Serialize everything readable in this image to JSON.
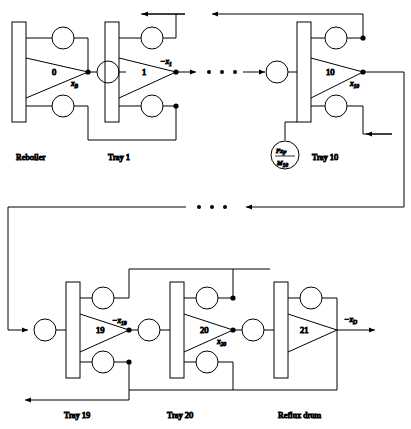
{
  "figure": {
    "type": "signal-flow-block-diagram",
    "stroke_color": "#000000",
    "background": "#ffffff"
  },
  "stages": [
    {
      "id": "reboiler",
      "caption": "Reboiler",
      "amplifier_number": "0",
      "output_signal": "x",
      "output_subscript": "B",
      "output_sign": "",
      "has_feed": false
    },
    {
      "id": "tray1",
      "caption": "Tray 1",
      "amplifier_number": "1",
      "output_signal": "x",
      "output_subscript": "1",
      "output_sign": "−",
      "has_feed": false
    },
    {
      "id": "tray10",
      "caption": "Tray 10",
      "amplifier_number": "10",
      "output_signal": "x",
      "output_subscript": "10",
      "output_sign": "",
      "has_feed": true,
      "feed_numerator": "Fx",
      "feed_numerator_sub": "F",
      "feed_denominator": "M",
      "feed_denominator_sub": "10"
    },
    {
      "id": "tray19",
      "caption": "Tray 19",
      "amplifier_number": "19",
      "output_signal": "x",
      "output_subscript": "19",
      "output_sign": "−",
      "has_feed": false
    },
    {
      "id": "tray20",
      "caption": "Tray 20",
      "amplifier_number": "20",
      "output_signal": "x",
      "output_subscript": "20",
      "output_sign": "",
      "has_feed": false
    },
    {
      "id": "refluxdrum",
      "caption": "Reflux drum",
      "amplifier_number": "21",
      "output_signal": "x",
      "output_subscript": "D",
      "output_sign": "−",
      "has_feed": false
    }
  ],
  "ellipses": [
    {
      "id": "ellipsis-top",
      "dots": 3,
      "label": "• • •"
    },
    {
      "id": "ellipsis-middle",
      "dots": 3,
      "label": "• • •"
    }
  ],
  "captions": {
    "reboiler": "Reboiler",
    "tray1": "Tray 1",
    "tray10": "Tray 10",
    "tray19": "Tray 19",
    "tray20": "Tray 20",
    "refluxdrum": "Reflux drum"
  },
  "signal_labels": {
    "xB": "x",
    "xB_sub": "B",
    "x1": "−x",
    "x1_sub": "1",
    "x10": "x",
    "x10_sub": "10",
    "x19": "−x",
    "x19_sub": "19",
    "x20": "x",
    "x20_sub": "20",
    "xD": "−x",
    "xD_sub": "D"
  },
  "amplifier_numbers": {
    "reboiler": "0",
    "tray1": "1",
    "tray10": "10",
    "tray19": "19",
    "tray20": "20",
    "refluxdrum": "21"
  },
  "feed_block": {
    "numerator": "Fx",
    "numerator_sub": "F",
    "denominator": "M",
    "denominator_sub": "10"
  }
}
